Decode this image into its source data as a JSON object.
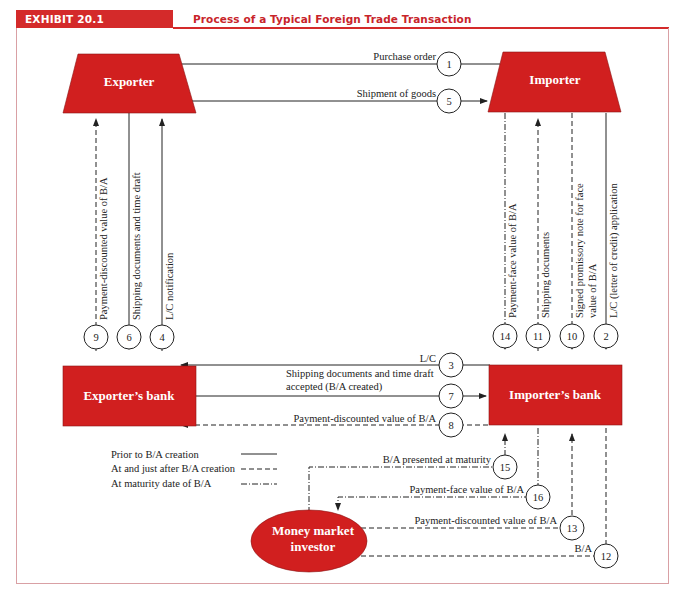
{
  "header": {
    "exhibit_label": "EXHIBIT 20.1",
    "title": "Process of a Typical Foreign Trade Transaction"
  },
  "colors": {
    "node_fill": "#d11f1f",
    "header_red": "#d42a2a",
    "frame_border": "#d9a0a4",
    "line": "#222222"
  },
  "nodes": {
    "exporter": "Exporter",
    "importer": "Importer",
    "exporters_bank": "Exporter’s bank",
    "importers_bank": "Importer’s bank",
    "investor_line1": "Money market",
    "investor_line2": "investor"
  },
  "steps": [
    {
      "num": "1",
      "label": "Purchase order",
      "from": "Importer",
      "to": "Exporter",
      "style": "solid"
    },
    {
      "num": "2",
      "label": "L/C (letter of credit) application",
      "from": "Importer",
      "to": "Importer’s bank",
      "style": "solid"
    },
    {
      "num": "3",
      "label": "L/C",
      "from": "Importer’s bank",
      "to": "Exporter’s bank",
      "style": "solid"
    },
    {
      "num": "4",
      "label": "L/C notification",
      "from": "Exporter’s bank",
      "to": "Exporter",
      "style": "solid"
    },
    {
      "num": "5",
      "label": "Shipment of goods",
      "from": "Exporter",
      "to": "Importer",
      "style": "solid"
    },
    {
      "num": "6",
      "label": "Shipping documents and time draft",
      "from": "Exporter",
      "to": "Exporter’s bank",
      "style": "solid"
    },
    {
      "num": "7",
      "label_line1": "Shipping documents and time draft",
      "label_line2": "accepted (B/A created)",
      "from": "Exporter’s bank",
      "to": "Importer’s bank",
      "style": "solid"
    },
    {
      "num": "8",
      "label": "Payment-discounted value of B/A",
      "from": "Importer’s bank",
      "to": "Exporter’s bank",
      "style": "dashed"
    },
    {
      "num": "9",
      "label": "Payment-discounted value of B/A",
      "from": "Exporter’s bank",
      "to": "Exporter",
      "style": "dashed"
    },
    {
      "num": "10",
      "label_line1": "Signed promissory note for face",
      "label_line2": "value of B/A",
      "from": "Importer",
      "to": "Importer’s bank",
      "style": "dashed"
    },
    {
      "num": "11",
      "label": "Shipping documents",
      "from": "Importer’s bank",
      "to": "Importer",
      "style": "dashed"
    },
    {
      "num": "12",
      "label": "B/A",
      "from": "Importer’s bank",
      "to": "Money market investor",
      "style": "dashed"
    },
    {
      "num": "13",
      "label": "Payment-discounted value of B/A",
      "from": "Money market investor",
      "to": "Importer’s bank",
      "style": "dashed"
    },
    {
      "num": "14",
      "label": "Payment-face value of B/A",
      "from": "Importer",
      "to": "Importer’s bank",
      "style": "dashdot"
    },
    {
      "num": "15",
      "label": "B/A presented at maturity",
      "from": "Money market investor",
      "to": "Importer’s bank",
      "style": "dashdot"
    },
    {
      "num": "16",
      "label": "Payment-face value of B/A",
      "from": "Importer’s bank",
      "to": "Money market investor",
      "style": "dashdot"
    }
  ],
  "legend": {
    "items": [
      {
        "label": "Prior to B/A creation",
        "style": "solid"
      },
      {
        "label": "At and just after B/A creation",
        "style": "dashed"
      },
      {
        "label": "At maturity date of B/A",
        "style": "dashdot"
      }
    ]
  }
}
